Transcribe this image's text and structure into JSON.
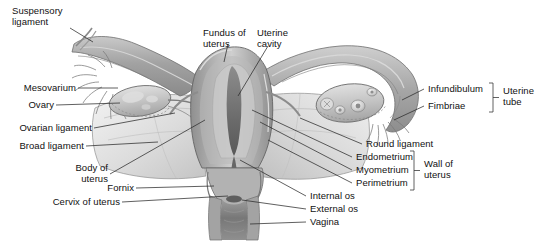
{
  "figure": {
    "background_color": "#ffffff",
    "line_color": "#2b2b2b",
    "text_color": "#111111"
  },
  "labels": {
    "suspensory_ligament": "Suspensory\nligament",
    "mesovarium": "Mesovarium",
    "ovary": "Ovary",
    "ovarian_ligament": "Ovarian ligament",
    "broad_ligament": "Broad ligament",
    "body_of_uterus": "Body of\nuterus",
    "fornix": "Fornix",
    "cervix_of_uterus": "Cervix of uterus",
    "fundus_of_uterus": "Fundus of\nuterus",
    "uterine_cavity": "Uterine\ncavity",
    "infundibulum": "Infundibulum",
    "fimbriae": "Fimbriae",
    "uterine_tube": "Uterine\ntube",
    "round_ligament": "Round ligament",
    "endometrium": "Endometrium",
    "myometrium": "Myometrium",
    "perimetrium": "Perimetrium",
    "wall_of_uterus": "Wall of\nuterus",
    "internal_os": "Internal os",
    "external_os": "External os",
    "vagina": "Vagina"
  },
  "brackets": {
    "uterine_tube_group": [
      "Infundibulum",
      "Fimbriae"
    ],
    "wall_of_uterus_group": [
      "Endometrium",
      "Myometrium",
      "Perimetrium"
    ]
  },
  "anatomy_colors": {
    "tube_outer": "#9a9a9a",
    "tube_mid": "#b4b4b4",
    "uterus_body": "#a8a8a8",
    "uterus_light": "#d6d6d6",
    "cavity_dark": "#6e6e6e",
    "ovary": "#c2c2c2",
    "ligament_sheet": "#e2e2e2",
    "vagina_dark": "#7a7a7a",
    "outline": "#5a5a5a"
  }
}
